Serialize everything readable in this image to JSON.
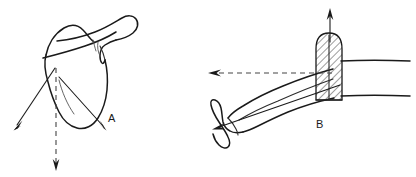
{
  "figure": {
    "background_color": "#ffffff",
    "ink_color": "#1a1a1a",
    "width": 416,
    "height": 177
  },
  "panels": [
    {
      "id": "panel-a",
      "label": "A",
      "label_x": 112,
      "label_y": 122,
      "subject": "scapula-posterior-view",
      "description": "Line drawing of a scapula with spine, acromion and coracoid process seen from behind",
      "arrows": [
        {
          "name": "inferior-lateral-force-arrow",
          "style": "solid",
          "direction": "down-left",
          "from": [
            55,
            68
          ],
          "to": [
            14,
            129
          ]
        },
        {
          "name": "inferior-medial-force-arrow",
          "style": "solid",
          "direction": "down-right",
          "from": [
            59,
            77
          ],
          "to": [
            106,
            130
          ]
        },
        {
          "name": "vertical-reference-axis-arrow",
          "style": "dashed",
          "direction": "down",
          "from": [
            56,
            68
          ],
          "to": [
            56,
            170
          ]
        }
      ]
    },
    {
      "id": "panel-b",
      "label": "B",
      "label_x": 320,
      "label_y": 128,
      "subject": "humerus-lateral-view-with-cut-section",
      "description": "Line drawing of the upper limb with a cross-hatched cut section through the proximal humerus and trunk outline at right",
      "arrows": [
        {
          "name": "superior-force-arrow",
          "style": "solid",
          "direction": "up",
          "from": [
            330,
            42
          ],
          "to": [
            330,
            9
          ]
        },
        {
          "name": "medial-reference-axis-arrow",
          "style": "dashed",
          "direction": "left",
          "from": [
            332,
            73
          ],
          "to": [
            209,
            73
          ]
        },
        {
          "name": "distal-traction-force-arrow",
          "style": "solid",
          "direction": "down-left",
          "from": [
            340,
            85
          ],
          "to": [
            214,
            129
          ]
        }
      ],
      "hatched_region": {
        "name": "cut-section-hatching",
        "fill_pattern": "diagonal-hatch",
        "stroke": "#1a1a1a"
      }
    }
  ]
}
